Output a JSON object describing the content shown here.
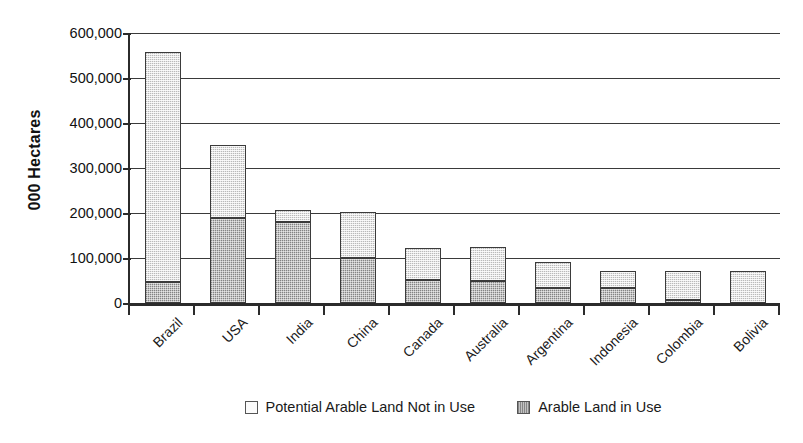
{
  "chart_data": {
    "type": "bar",
    "subtype": "stacked-vertical",
    "title": "",
    "xlabel": "",
    "ylabel": "000 Hectares",
    "ylim": [
      0,
      600000
    ],
    "ytick_labels": [
      "600,000",
      "500,000",
      "400,000",
      "300,000",
      "200,000",
      "100,000",
      "0"
    ],
    "ytick_values": [
      600000,
      500000,
      400000,
      300000,
      200000,
      100000,
      0
    ],
    "grid": true,
    "grid_axis": "y",
    "legend_position": "bottom-center",
    "categories": [
      "Brazil",
      "USA",
      "India",
      "China",
      "Canada",
      "Australia",
      "Argentina",
      "Indonesia",
      "Colombia",
      "Bolivia"
    ],
    "series": [
      {
        "name": "Arable Land in Use",
        "color": "#c3c3c3",
        "values": [
          47000,
          190000,
          180000,
          100000,
          51000,
          49000,
          33000,
          34000,
          5000,
          0
        ]
      },
      {
        "name": "Potential Arable Land Not in Use",
        "color": "#e6e6e6",
        "values": [
          511000,
          161000,
          27000,
          102000,
          71000,
          75000,
          58000,
          37000,
          65000,
          71000
        ]
      }
    ],
    "totals": [
      558000,
      351000,
      207000,
      202000,
      122000,
      124000,
      91000,
      71000,
      70000,
      71000
    ]
  },
  "legend": {
    "entries": [
      {
        "label": "Potential Arable Land Not in Use",
        "swatch": "legend-swatch-potential"
      },
      {
        "label": "Arable Land in Use",
        "swatch": "legend-swatch-inuse"
      }
    ]
  }
}
